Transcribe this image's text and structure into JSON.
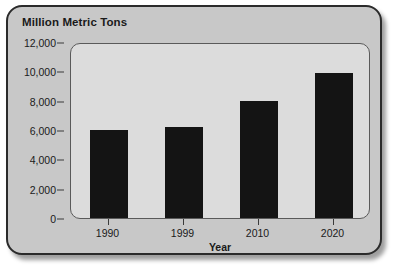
{
  "chart_data": {
    "type": "bar",
    "title": "Million Metric Tons",
    "xlabel": "Year",
    "ylabel": "",
    "categories": [
      "1990",
      "1999",
      "2010",
      "2020"
    ],
    "values": [
      6000,
      6200,
      8000,
      9900
    ],
    "series": [
      {
        "name": "Million Metric Tons",
        "values": [
          6000,
          6200,
          8000,
          9900
        ]
      }
    ],
    "ylim": [
      0,
      12000
    ],
    "y_ticks": [
      0,
      2000,
      4000,
      6000,
      8000,
      10000,
      12000
    ],
    "y_tick_labels": [
      "0",
      "2,000",
      "4,000",
      "6,000",
      "8,000",
      "10,000",
      "12,000"
    ],
    "x_tick_labels": [
      "1990",
      "1999",
      "2010",
      "2020"
    ],
    "grid": false,
    "legend": false,
    "legend_position": "none",
    "bar_color": "#141414",
    "plot_background": "#dcdcdc",
    "panel_background": "#c8c8c8",
    "border_color": "#2b2b2b"
  }
}
